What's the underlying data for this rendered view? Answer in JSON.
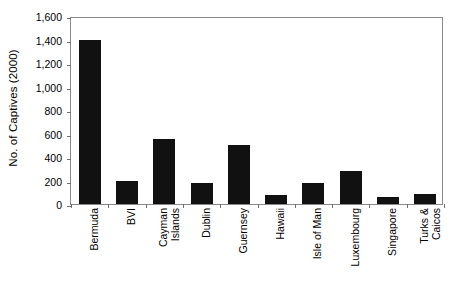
{
  "chart_data": {
    "type": "bar",
    "title": "",
    "xlabel": "",
    "ylabel": "No. of Captives (2000)",
    "categories": [
      "Bermuda",
      "BVI",
      "Cayman\nIslands",
      "Dublin",
      "Guernsey",
      "Hawaii",
      "Isle of Man",
      "Luxembourg",
      "Singapore",
      "Turks &\nCaicos"
    ],
    "values": [
      1400,
      200,
      550,
      175,
      500,
      80,
      180,
      280,
      60,
      85
    ],
    "ylim": [
      0,
      1600
    ],
    "ytick_values": [
      0,
      200,
      400,
      600,
      800,
      1000,
      1200,
      1400,
      1600
    ],
    "ytick_labels": [
      "0",
      "200",
      "400",
      "600",
      "800",
      "1,000",
      "1,200",
      "1,400",
      "1,600"
    ],
    "grid": false,
    "legend": false,
    "bar_color": "#111111",
    "axis_color": "#8a8a8a",
    "background_color": "#ffffff"
  }
}
